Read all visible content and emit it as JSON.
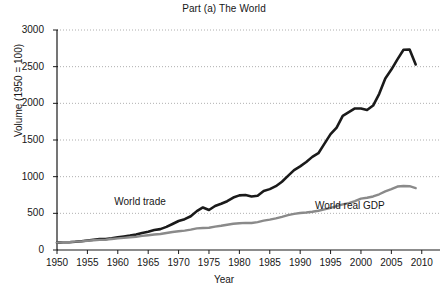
{
  "chart_data": {
    "type": "line",
    "title": "Part (a) The World",
    "xlabel": "Year",
    "ylabel": "Volume (1950 = 100)",
    "xlim": [
      1950,
      2013
    ],
    "ylim": [
      0,
      3000
    ],
    "xticks": [
      1950,
      1955,
      1960,
      1965,
      1970,
      1975,
      1980,
      1985,
      1990,
      1995,
      2000,
      2005,
      2010
    ],
    "yticks": [
      0,
      500,
      1000,
      1500,
      2000,
      2500,
      3000
    ],
    "grid": "horizontal-dotted",
    "legend": "inline-annotations",
    "x": [
      1950,
      1951,
      1952,
      1953,
      1954,
      1955,
      1956,
      1957,
      1958,
      1959,
      1960,
      1961,
      1962,
      1963,
      1964,
      1965,
      1966,
      1967,
      1968,
      1969,
      1970,
      1971,
      1972,
      1973,
      1974,
      1975,
      1976,
      1977,
      1978,
      1979,
      1980,
      1981,
      1982,
      1983,
      1984,
      1985,
      1986,
      1987,
      1988,
      1989,
      1990,
      1991,
      1992,
      1993,
      1994,
      1995,
      1996,
      1997,
      1998,
      1999,
      2000,
      2001,
      2002,
      2003,
      2004,
      2005,
      2006,
      2007,
      2008,
      2009
    ],
    "series": [
      {
        "name": "World trade",
        "color": "#1a1a1a",
        "label_x": 1966,
        "label_y": 640,
        "values": [
          100,
          105,
          106,
          112,
          120,
          130,
          140,
          148,
          148,
          160,
          175,
          185,
          196,
          210,
          232,
          250,
          272,
          285,
          315,
          355,
          395,
          420,
          460,
          530,
          580,
          545,
          600,
          630,
          665,
          715,
          745,
          750,
          730,
          740,
          805,
          830,
          870,
          930,
          1010,
          1090,
          1140,
          1200,
          1270,
          1320,
          1450,
          1580,
          1670,
          1830,
          1880,
          1930,
          1930,
          1910,
          1970,
          2130,
          2340,
          2460,
          2600,
          2730,
          2735,
          2530
        ]
      },
      {
        "name": "World real GDP",
        "color": "#8a8a8a",
        "label_x": 1999,
        "label_y": 585,
        "values": [
          100,
          105,
          108,
          114,
          118,
          126,
          132,
          138,
          142,
          150,
          158,
          165,
          173,
          181,
          192,
          202,
          212,
          219,
          232,
          245,
          255,
          265,
          278,
          295,
          300,
          303,
          318,
          330,
          345,
          358,
          365,
          370,
          368,
          380,
          400,
          415,
          432,
          452,
          475,
          492,
          505,
          512,
          522,
          535,
          555,
          575,
          598,
          622,
          640,
          665,
          700,
          712,
          730,
          760,
          800,
          830,
          865,
          872,
          870,
          845
        ]
      }
    ]
  }
}
